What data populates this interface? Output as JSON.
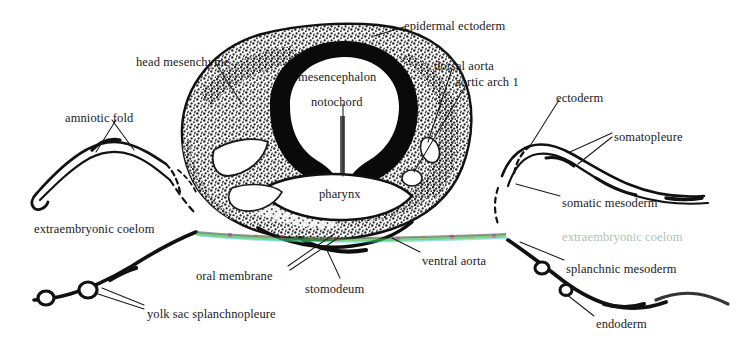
{
  "figure": {
    "kind": "histological-cross-section",
    "background_color": "#ffffff",
    "ink_color": "#1a1a1a",
    "faded_label_color": "#7e9c84",
    "artifact_colors": [
      "#39c14a",
      "#e04ab5",
      "#3fc4d0",
      "#f0a020"
    ]
  },
  "labels": [
    {
      "id": "epidermal-ectoderm",
      "text": "epidermal ectoderm",
      "x": 404,
      "y": 20,
      "align": "left"
    },
    {
      "id": "head-mesenchyme",
      "text": "head mesenchyme",
      "x": 136,
      "y": 56,
      "align": "left"
    },
    {
      "id": "mesencephalon",
      "text": "mesencephalon",
      "x": 298,
      "y": 71,
      "align": "left"
    },
    {
      "id": "dorsal-aorta",
      "text": "dorsal aorta",
      "x": 434,
      "y": 60,
      "align": "left"
    },
    {
      "id": "aortic-arch-1",
      "text": "aortic arch 1",
      "x": 455,
      "y": 76,
      "align": "left"
    },
    {
      "id": "notochord",
      "text": "notochord",
      "x": 311,
      "y": 96,
      "align": "left"
    },
    {
      "id": "ectoderm",
      "text": "ectoderm",
      "x": 556,
      "y": 92,
      "align": "left"
    },
    {
      "id": "amniotic-fold",
      "text": "amniotic fold",
      "x": 65,
      "y": 112,
      "align": "left"
    },
    {
      "id": "somatopleure",
      "text": "somatopleure",
      "x": 614,
      "y": 131,
      "align": "left"
    },
    {
      "id": "pharynx",
      "text": "pharynx",
      "x": 319,
      "y": 188,
      "align": "left"
    },
    {
      "id": "somatic-mesoderm",
      "text": "somatic mesoderm",
      "x": 562,
      "y": 197,
      "align": "left"
    },
    {
      "id": "extraembryonic-coelom-l",
      "text": "extraembryonic coelom",
      "x": 34,
      "y": 223,
      "align": "left"
    },
    {
      "id": "extraembryonic-coelom-r",
      "text": "extraembryonic coelom",
      "x": 562,
      "y": 231,
      "align": "left",
      "style": "faded"
    },
    {
      "id": "ventral-aorta",
      "text": "ventral aorta",
      "x": 422,
      "y": 255,
      "align": "left"
    },
    {
      "id": "oral-membrane",
      "text": "oral membrane",
      "x": 196,
      "y": 270,
      "align": "left"
    },
    {
      "id": "splanchnic-mesoderm",
      "text": "splanchnic mesoderm",
      "x": 566,
      "y": 263,
      "align": "left"
    },
    {
      "id": "stomodeum",
      "text": "stomodeum",
      "x": 305,
      "y": 283,
      "align": "left"
    },
    {
      "id": "yolk-sac-splanchnopleure",
      "text": "yolk sac splanchnopleure",
      "x": 147,
      "y": 308,
      "align": "left"
    },
    {
      "id": "endoderm",
      "text": "endoderm",
      "x": 596,
      "y": 318,
      "align": "left"
    }
  ],
  "structures": [
    {
      "id": "neural-tube-wall",
      "name": "neural tube wall (dark ring)"
    },
    {
      "id": "mesencephalon-cavity",
      "name": "mesencephalon cavity"
    },
    {
      "id": "head-mesenchyme-mass",
      "name": "head mesenchyme (stippled tissue)"
    },
    {
      "id": "pharynx-cavity",
      "name": "pharyngeal cavity"
    },
    {
      "id": "amnion-membrane-left",
      "name": "left amniotic fold membrane"
    },
    {
      "id": "amnion-membrane-right",
      "name": "right somatopleure membrane"
    },
    {
      "id": "yolk-sac-membrane-left",
      "name": "left yolk sac splanchnopleure"
    },
    {
      "id": "yolk-sac-membrane-right",
      "name": "right splanchnopleure / endoderm"
    },
    {
      "id": "scan-artifact-line",
      "name": "colored horizontal scan artifact"
    }
  ]
}
